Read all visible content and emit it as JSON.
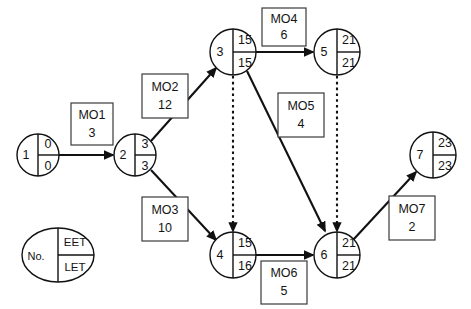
{
  "diagram": {
    "type": "network",
    "stroke_color": "#111111",
    "fill_color": "#ffffff",
    "nodes": [
      {
        "id": "1",
        "number": "1",
        "eet": "0",
        "let": "0",
        "cx": 38,
        "cy": 155,
        "r": 21
      },
      {
        "id": "2",
        "number": "2",
        "eet": "3",
        "let": "3",
        "cx": 135,
        "cy": 155,
        "r": 21
      },
      {
        "id": "3",
        "number": "3",
        "eet": "15",
        "let": "15",
        "cx": 233,
        "cy": 52,
        "r": 23
      },
      {
        "id": "4",
        "number": "4",
        "eet": "15",
        "let": "16",
        "cx": 233,
        "cy": 255,
        "r": 23
      },
      {
        "id": "5",
        "number": "5",
        "eet": "21",
        "let": "21",
        "cx": 337,
        "cy": 52,
        "r": 23
      },
      {
        "id": "6",
        "number": "6",
        "eet": "21",
        "let": "21",
        "cx": 337,
        "cy": 255,
        "r": 23
      },
      {
        "id": "7",
        "number": "7",
        "eet": "23",
        "let": "23",
        "cx": 433,
        "cy": 155,
        "r": 23
      }
    ],
    "edges": [
      {
        "id": "MO1",
        "from": "1",
        "to": "2",
        "style": "solid",
        "x1": 59,
        "y1": 155,
        "x2": 113,
        "y2": 155
      },
      {
        "id": "MO2",
        "from": "2",
        "to": "3",
        "style": "solid",
        "x1": 151,
        "y1": 141,
        "x2": 216,
        "y2": 68
      },
      {
        "id": "MO3",
        "from": "2",
        "to": "4",
        "style": "solid",
        "x1": 151,
        "y1": 170,
        "x2": 216,
        "y2": 240
      },
      {
        "id": "MO4",
        "from": "3",
        "to": "5",
        "style": "solid",
        "x1": 256,
        "y1": 52,
        "x2": 313,
        "y2": 52
      },
      {
        "id": "MO5",
        "from": "3",
        "to": "6",
        "style": "solid",
        "x1": 247,
        "y1": 71,
        "x2": 325,
        "y2": 231
      },
      {
        "id": "MO6",
        "from": "4",
        "to": "6",
        "style": "solid",
        "x1": 256,
        "y1": 255,
        "x2": 313,
        "y2": 255
      },
      {
        "id": "MO7",
        "from": "6",
        "to": "7",
        "style": "solid",
        "x1": 353,
        "y1": 240,
        "x2": 416,
        "y2": 172
      },
      {
        "id": "D1",
        "from": "3",
        "to": "4",
        "style": "dashed",
        "x1": 233,
        "y1": 76,
        "x2": 233,
        "y2": 231
      },
      {
        "id": "D2",
        "from": "5",
        "to": "6",
        "style": "dashed",
        "x1": 337,
        "y1": 76,
        "x2": 337,
        "y2": 231
      }
    ],
    "activities": [
      {
        "id": "MO1",
        "name": "MO1",
        "duration": "3",
        "x": 71,
        "y": 103,
        "w": 42,
        "h": 42
      },
      {
        "id": "MO2",
        "name": "MO2",
        "duration": "12",
        "x": 142,
        "y": 74,
        "w": 46,
        "h": 44
      },
      {
        "id": "MO3",
        "name": "MO3",
        "duration": "10",
        "x": 142,
        "y": 197,
        "w": 46,
        "h": 44
      },
      {
        "id": "MO4",
        "name": "MO4",
        "duration": "6",
        "x": 262,
        "y": 8,
        "w": 44,
        "h": 38
      },
      {
        "id": "MO5",
        "name": "MO5",
        "duration": "4",
        "x": 278,
        "y": 93,
        "w": 46,
        "h": 44
      },
      {
        "id": "MO6",
        "name": "MO6",
        "duration": "5",
        "x": 261,
        "y": 261,
        "w": 46,
        "h": 43
      },
      {
        "id": "MO7",
        "name": "MO7",
        "duration": "2",
        "x": 389,
        "y": 196,
        "w": 46,
        "h": 44
      }
    ],
    "legend": {
      "number_label": "No.",
      "eet_label": "EET",
      "let_label": "LET",
      "cx": 58,
      "cy": 255,
      "rx": 36,
      "ry": 27
    }
  }
}
